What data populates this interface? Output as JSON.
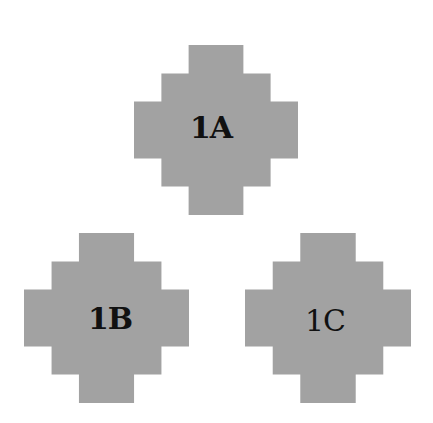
{
  "figure": {
    "shape_color": "#a2a2a2",
    "text_color": "#111111",
    "shapes": [
      {
        "id": "1A",
        "label": "1A",
        "weight": "bold"
      },
      {
        "id": "1B",
        "label": "1B",
        "weight": "bold"
      },
      {
        "id": "1C",
        "label": "1C",
        "weight": "regular"
      }
    ]
  }
}
